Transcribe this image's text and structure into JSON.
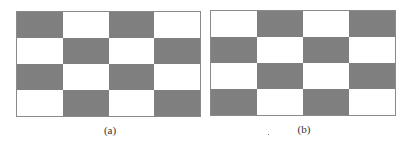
{
  "figure": {
    "panels": [
      {
        "id": "a",
        "label": "(a)",
        "rows": 4,
        "cols": 4,
        "pattern": [
          [
            "dark",
            "light",
            "dark",
            "light"
          ],
          [
            "light",
            "dark",
            "light",
            "dark"
          ],
          [
            "dark",
            "light",
            "dark",
            "light"
          ],
          [
            "light",
            "dark",
            "light",
            "dark"
          ]
        ]
      },
      {
        "id": "b",
        "label": "(b)",
        "rows": 4,
        "cols": 4,
        "pattern": [
          [
            "light",
            "dark",
            "light",
            "dark"
          ],
          [
            "dark",
            "light",
            "dark",
            "light"
          ],
          [
            "light",
            "dark",
            "light",
            "dark"
          ],
          [
            "dark",
            "light",
            "dark",
            "light"
          ]
        ]
      }
    ],
    "colors": {
      "dark": "#8e8e8e",
      "light": "#ffffff",
      "border": "#8a8a8a"
    }
  }
}
